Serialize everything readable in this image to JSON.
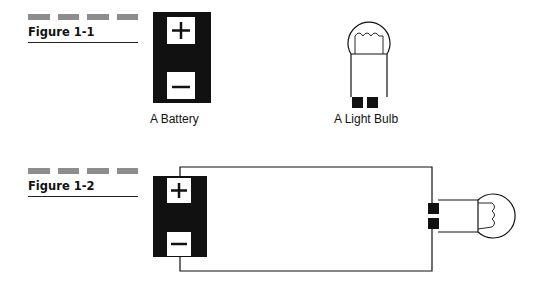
{
  "figures": [
    {
      "label": "Figure 1-1",
      "captions": {
        "battery": "A Battery",
        "bulb": "A Light Bulb"
      }
    },
    {
      "label": "Figure 1-2"
    }
  ],
  "symbols": {
    "positive": "+",
    "negative": "−"
  },
  "colors": {
    "ink": "#111111",
    "dash_gray": "#8d8d8d",
    "background": "#ffffff"
  }
}
